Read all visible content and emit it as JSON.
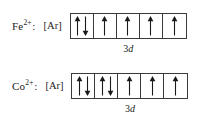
{
  "figure": {
    "background_color": "#ffffff",
    "ink_color": "#1a1a1a",
    "box_border_color": "#3a3a3a"
  },
  "rows": [
    {
      "element": "Fe",
      "charge": "2+",
      "colon": ":",
      "core": "[Ar]",
      "subshell_principal": "3",
      "subshell_letter": "d",
      "subshell_label": "3d",
      "electron_count": 6,
      "orbitals": [
        {
          "index": 1,
          "spins": [
            "up",
            "down"
          ]
        },
        {
          "index": 2,
          "spins": [
            "up"
          ]
        },
        {
          "index": 3,
          "spins": [
            "up"
          ]
        },
        {
          "index": 4,
          "spins": [
            "up"
          ]
        },
        {
          "index": 5,
          "spins": [
            "up"
          ]
        }
      ]
    },
    {
      "element": "Co",
      "charge": "2+",
      "colon": ":",
      "core": "[Ar]",
      "subshell_principal": "3",
      "subshell_letter": "d",
      "subshell_label": "3d",
      "electron_count": 7,
      "orbitals": [
        {
          "index": 1,
          "spins": [
            "up",
            "down"
          ]
        },
        {
          "index": 2,
          "spins": [
            "up",
            "down"
          ]
        },
        {
          "index": 3,
          "spins": [
            "up"
          ]
        },
        {
          "index": 4,
          "spins": [
            "up"
          ]
        },
        {
          "index": 5,
          "spins": [
            "up"
          ]
        }
      ]
    }
  ]
}
